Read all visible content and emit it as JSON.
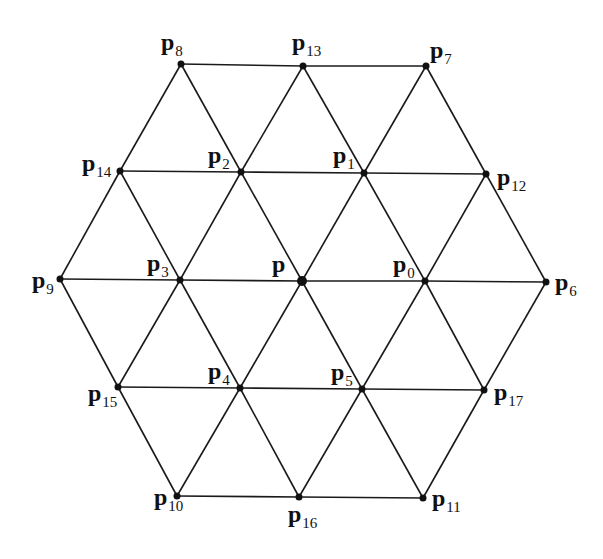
{
  "diagram": {
    "title": "",
    "type": "hexagonal triangular mesh neighborhood",
    "nodes": [
      {
        "id": "p",
        "label": "p",
        "sub": "",
        "x": 302,
        "y": 281,
        "r": 5,
        "lx": 272,
        "ly": 272
      },
      {
        "id": "p0",
        "label": "p",
        "sub": "0",
        "x": 425,
        "y": 281,
        "r": 3.5,
        "lx": 393,
        "ly": 272
      },
      {
        "id": "p1",
        "label": "p",
        "sub": "1",
        "x": 364,
        "y": 173,
        "r": 3.5,
        "lx": 333,
        "ly": 163
      },
      {
        "id": "p2",
        "label": "p",
        "sub": "2",
        "x": 241,
        "y": 172,
        "r": 3.5,
        "lx": 208,
        "ly": 163
      },
      {
        "id": "p3",
        "label": "p",
        "sub": "3",
        "x": 180,
        "y": 280,
        "r": 3.5,
        "lx": 147,
        "ly": 271
      },
      {
        "id": "p4",
        "label": "p",
        "sub": "4",
        "x": 240,
        "y": 388,
        "r": 3.5,
        "lx": 208,
        "ly": 379
      },
      {
        "id": "p5",
        "label": "p",
        "sub": "5",
        "x": 362,
        "y": 389,
        "r": 3.5,
        "lx": 331,
        "ly": 380
      },
      {
        "id": "p6",
        "label": "p",
        "sub": "6",
        "x": 546,
        "y": 282,
        "r": 3.5,
        "lx": 555,
        "ly": 290
      },
      {
        "id": "p7",
        "label": "p",
        "sub": "7",
        "x": 426,
        "y": 66,
        "r": 3.5,
        "lx": 430,
        "ly": 58
      },
      {
        "id": "p8",
        "label": "p",
        "sub": "8",
        "x": 181,
        "y": 64,
        "r": 3.5,
        "lx": 161,
        "ly": 50
      },
      {
        "id": "p9",
        "label": "p",
        "sub": "9",
        "x": 60,
        "y": 279,
        "r": 3.5,
        "lx": 32,
        "ly": 288
      },
      {
        "id": "p10",
        "label": "p",
        "sub": "10",
        "x": 177,
        "y": 496,
        "r": 3.5,
        "lx": 154,
        "ly": 505
      },
      {
        "id": "p11",
        "label": "p",
        "sub": "11",
        "x": 423,
        "y": 498,
        "r": 3.5,
        "lx": 432,
        "ly": 506
      },
      {
        "id": "p12",
        "label": "p",
        "sub": "12",
        "x": 486,
        "y": 174,
        "r": 3.5,
        "lx": 497,
        "ly": 185
      },
      {
        "id": "p13",
        "label": "p",
        "sub": "13",
        "x": 303,
        "y": 66,
        "r": 3.5,
        "lx": 292,
        "ly": 50
      },
      {
        "id": "p14",
        "label": "p",
        "sub": "14",
        "x": 120,
        "y": 171,
        "r": 3.5,
        "lx": 82,
        "ly": 171
      },
      {
        "id": "p15",
        "label": "p",
        "sub": "15",
        "x": 118,
        "y": 387,
        "r": 3.5,
        "lx": 88,
        "ly": 401
      },
      {
        "id": "p16",
        "label": "p",
        "sub": "16",
        "x": 299,
        "y": 497,
        "r": 3.5,
        "lx": 288,
        "ly": 522
      },
      {
        "id": "p17",
        "label": "p",
        "sub": "17",
        "x": 484,
        "y": 390,
        "r": 3.5,
        "lx": 494,
        "ly": 400
      }
    ],
    "edges": [
      [
        "p8",
        "p13"
      ],
      [
        "p13",
        "p7"
      ],
      [
        "p14",
        "p2"
      ],
      [
        "p2",
        "p1"
      ],
      [
        "p1",
        "p12"
      ],
      [
        "p9",
        "p3"
      ],
      [
        "p3",
        "p"
      ],
      [
        "p",
        "p0"
      ],
      [
        "p0",
        "p6"
      ],
      [
        "p15",
        "p4"
      ],
      [
        "p4",
        "p5"
      ],
      [
        "p5",
        "p17"
      ],
      [
        "p10",
        "p16"
      ],
      [
        "p16",
        "p11"
      ],
      [
        "p8",
        "p14"
      ],
      [
        "p8",
        "p2"
      ],
      [
        "p13",
        "p2"
      ],
      [
        "p13",
        "p1"
      ],
      [
        "p7",
        "p1"
      ],
      [
        "p7",
        "p12"
      ],
      [
        "p14",
        "p9"
      ],
      [
        "p14",
        "p3"
      ],
      [
        "p2",
        "p3"
      ],
      [
        "p2",
        "p"
      ],
      [
        "p1",
        "p"
      ],
      [
        "p1",
        "p0"
      ],
      [
        "p12",
        "p0"
      ],
      [
        "p12",
        "p6"
      ],
      [
        "p9",
        "p15"
      ],
      [
        "p3",
        "p15"
      ],
      [
        "p3",
        "p4"
      ],
      [
        "p",
        "p4"
      ],
      [
        "p",
        "p5"
      ],
      [
        "p0",
        "p5"
      ],
      [
        "p0",
        "p17"
      ],
      [
        "p6",
        "p17"
      ],
      [
        "p15",
        "p10"
      ],
      [
        "p4",
        "p10"
      ],
      [
        "p4",
        "p16"
      ],
      [
        "p5",
        "p16"
      ],
      [
        "p5",
        "p11"
      ],
      [
        "p17",
        "p11"
      ]
    ],
    "colors": {
      "line": "#1a1a1a",
      "node": "#111111",
      "background": "#ffffff"
    }
  }
}
